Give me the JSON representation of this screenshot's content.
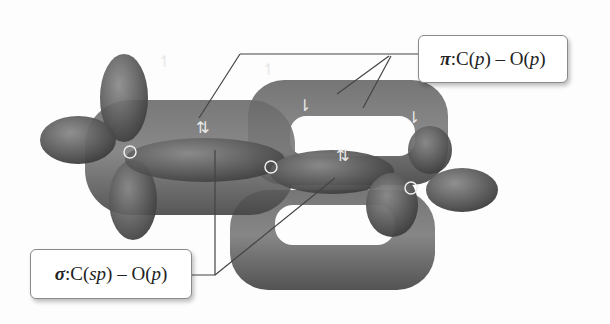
{
  "diagram": {
    "atoms": [
      {
        "symbol": "O",
        "x": 130,
        "y": 152
      },
      {
        "symbol": "C",
        "x": 270,
        "y": 167
      },
      {
        "symbol": "O",
        "x": 411,
        "y": 188
      }
    ],
    "labels": {
      "pi": {
        "symbol": "π",
        "sep": ":",
        "text_a": " C(",
        "orb_a": "p",
        "text_b": ") – O(",
        "orb_b": "p",
        "text_c": ")"
      },
      "sigma": {
        "symbol": "σ",
        "sep": ":",
        "text_a": " C(",
        "orb_a": "sp",
        "text_b": ") – O(",
        "orb_b": "p",
        "text_c": ")"
      }
    },
    "spins": [
      {
        "glyph": "↿",
        "x": 158,
        "y": 52
      },
      {
        "glyph": "⇅",
        "x": 196,
        "y": 120
      },
      {
        "glyph": "↿",
        "x": 262,
        "y": 62
      },
      {
        "glyph": "⇂",
        "x": 300,
        "y": 98
      },
      {
        "glyph": "⇅",
        "x": 336,
        "y": 148
      },
      {
        "glyph": "⇂",
        "x": 407,
        "y": 110
      }
    ],
    "colors": {
      "orbital": "#5a5a5a",
      "orbital_dark": "#3e3e3e",
      "leader": "#444444",
      "box_border": "#8a8a8a"
    }
  }
}
